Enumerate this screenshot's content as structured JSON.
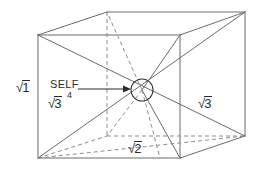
{
  "figure": {
    "background_color": "#ffffff",
    "line_color": "#6b6b6b",
    "text_color": "#2b2b2b",
    "width": 261,
    "height": 170
  },
  "labels": {
    "sqrt1": {
      "radical": "√",
      "body": "1"
    },
    "sqrt2": {
      "radical": "√",
      "body": "2"
    },
    "sqrt3_right": {
      "radical": "√",
      "body": "3"
    },
    "sqrt3_left": {
      "radical": "√",
      "body": "3"
    },
    "self": "SELF",
    "four": "4"
  },
  "geometry": {
    "front_face": {
      "top_left": [
        38,
        35
      ],
      "top_right": [
        180,
        35
      ],
      "bottom_right": [
        180,
        158
      ],
      "bottom_left": [
        38,
        158
      ]
    },
    "back_face": {
      "top_left": [
        107,
        12
      ],
      "top_right": [
        245,
        12
      ],
      "bottom_right": [
        245,
        136
      ],
      "bottom_left": [
        107,
        136
      ]
    },
    "center_marker": {
      "cx": 142,
      "cy": 90,
      "r": 11
    },
    "arrow": {
      "x1": 78,
      "y1": 89,
      "x2": 130,
      "y2": 89
    }
  }
}
